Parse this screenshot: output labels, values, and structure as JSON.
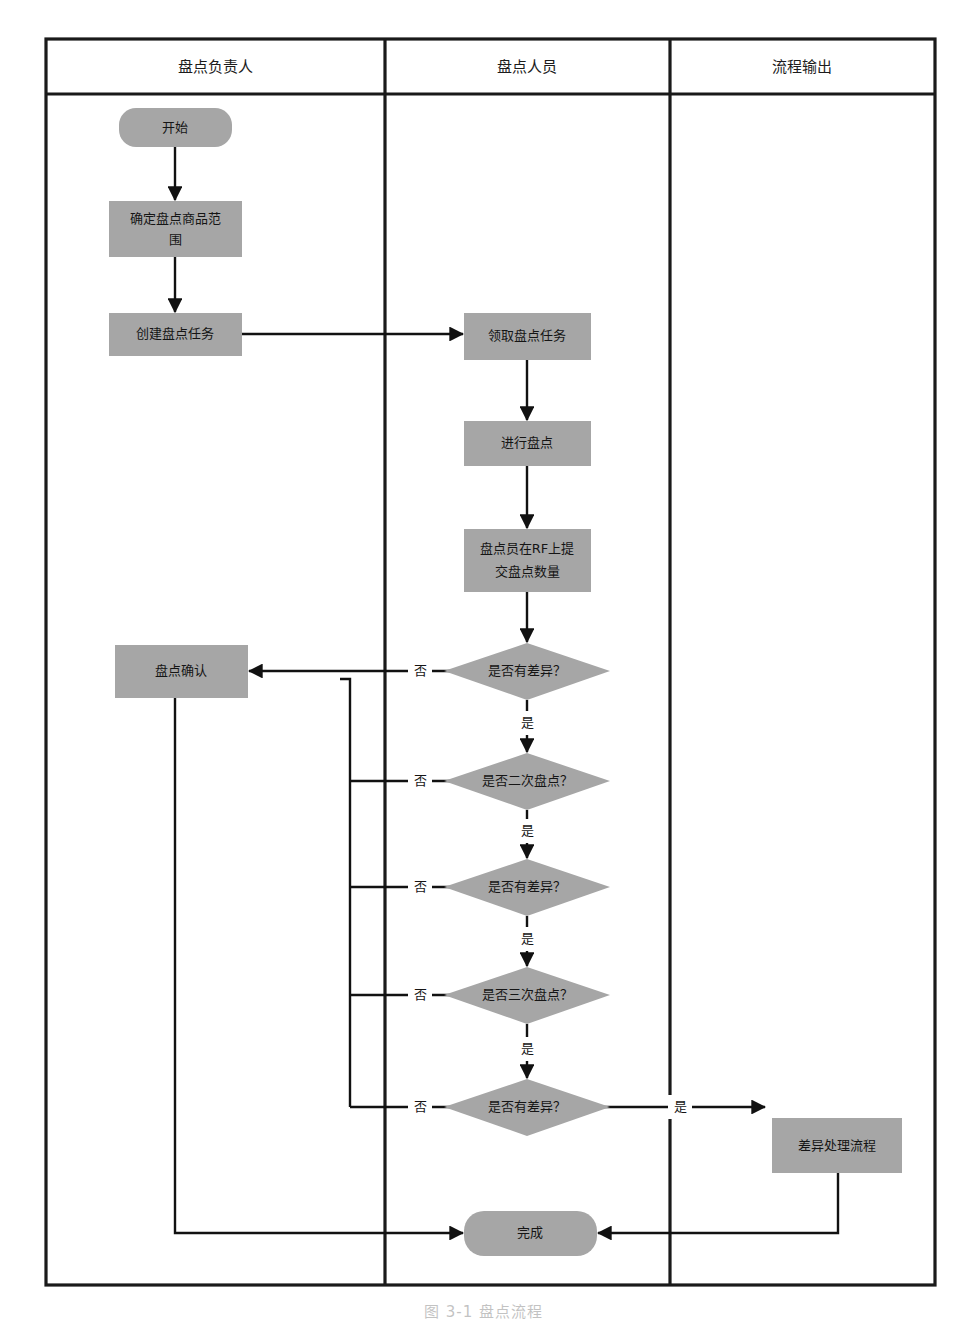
{
  "diagram": {
    "title": "盘点流程",
    "caption": "图 3-1 盘点流程",
    "type": "swimlane-flowchart",
    "fill_color": "#a6a6a6",
    "line_color": "#111111",
    "background_color": "#ffffff"
  },
  "lanes": [
    {
      "id": "lane-owner",
      "label": "盘点负责人"
    },
    {
      "id": "lane-staff",
      "label": "盘点人员"
    },
    {
      "id": "lane-output",
      "label": "流程输出"
    }
  ],
  "nodes": [
    {
      "id": "start",
      "label": "开始",
      "shape": "rounded",
      "lane": "lane-owner"
    },
    {
      "id": "scope",
      "label": "确定盘点商品范围",
      "shape": "rect",
      "lane": "lane-owner"
    },
    {
      "id": "create",
      "label": "创建盘点任务",
      "shape": "rect",
      "lane": "lane-owner"
    },
    {
      "id": "confirm",
      "label": "盘点确认",
      "shape": "rect",
      "lane": "lane-owner"
    },
    {
      "id": "receive",
      "label": "领取盘点任务",
      "shape": "rect",
      "lane": "lane-staff"
    },
    {
      "id": "count",
      "label": "进行盘点",
      "shape": "rect",
      "lane": "lane-staff"
    },
    {
      "id": "submit",
      "label": "盘点员在RF上提交盘点数量",
      "shape": "rect",
      "lane": "lane-staff",
      "lines": [
        "盘点员在RF上提",
        "交盘点数量"
      ]
    },
    {
      "id": "diff1",
      "label": "是否有差异？",
      "shape": "diamond",
      "lane": "lane-staff"
    },
    {
      "id": "second",
      "label": "是否二次盘点？",
      "shape": "diamond",
      "lane": "lane-staff"
    },
    {
      "id": "diff2",
      "label": "是否有差异？",
      "shape": "diamond",
      "lane": "lane-staff"
    },
    {
      "id": "third",
      "label": "是否三次盘点？",
      "shape": "diamond",
      "lane": "lane-staff"
    },
    {
      "id": "diff3",
      "label": "是否有差异？",
      "shape": "diamond",
      "lane": "lane-staff"
    },
    {
      "id": "done",
      "label": "完成",
      "shape": "rounded",
      "lane": "lane-staff"
    },
    {
      "id": "discrepancy",
      "label": "差异处理流程",
      "shape": "rect",
      "lane": "lane-output"
    }
  ],
  "edges": [
    {
      "from": "start",
      "to": "scope",
      "label": ""
    },
    {
      "from": "scope",
      "to": "create",
      "label": ""
    },
    {
      "from": "create",
      "to": "receive",
      "label": ""
    },
    {
      "from": "receive",
      "to": "count",
      "label": ""
    },
    {
      "from": "count",
      "to": "submit",
      "label": ""
    },
    {
      "from": "submit",
      "to": "diff1",
      "label": ""
    },
    {
      "from": "diff1",
      "to": "confirm",
      "label": "否"
    },
    {
      "from": "diff1",
      "to": "second",
      "label": "是"
    },
    {
      "from": "second",
      "to": "confirm",
      "label": "否"
    },
    {
      "from": "second",
      "to": "diff2",
      "label": "是"
    },
    {
      "from": "diff2",
      "to": "confirm",
      "label": "否"
    },
    {
      "from": "diff2",
      "to": "third",
      "label": "是"
    },
    {
      "from": "third",
      "to": "confirm",
      "label": "否"
    },
    {
      "from": "third",
      "to": "diff3",
      "label": "是"
    },
    {
      "from": "diff3",
      "to": "confirm",
      "label": "否"
    },
    {
      "from": "diff3",
      "to": "discrepancy",
      "label": "是"
    },
    {
      "from": "confirm",
      "to": "done",
      "label": ""
    },
    {
      "from": "discrepancy",
      "to": "done",
      "label": ""
    }
  ],
  "labels": {
    "yes": "是",
    "no": "否"
  },
  "text": {
    "lane_owner": "盘点负责人",
    "lane_staff": "盘点人员",
    "lane_output": "流程输出",
    "n_start": "开始",
    "n_scope_l1": "确定盘点商品范",
    "n_scope_l2": "围",
    "n_create": "创建盘点任务",
    "n_confirm": "盘点确认",
    "n_receive": "领取盘点任务",
    "n_count": "进行盘点",
    "n_submit_l1": "盘点员在RF上提",
    "n_submit_l2": "交盘点数量",
    "n_diff1": "是否有差异？",
    "n_second": "是否二次盘点？",
    "n_diff2": "是否有差异？",
    "n_third": "是否三次盘点？",
    "n_diff3": "是否有差异？",
    "n_done": "完成",
    "n_discrepancy": "差异处理流程",
    "no1": "否",
    "no2": "否",
    "no3": "否",
    "no4": "否",
    "no5": "否",
    "yes1": "是",
    "yes2": "是",
    "yes3": "是",
    "yes4": "是",
    "yes5": "是",
    "caption": "图 3-1 盘点流程"
  }
}
